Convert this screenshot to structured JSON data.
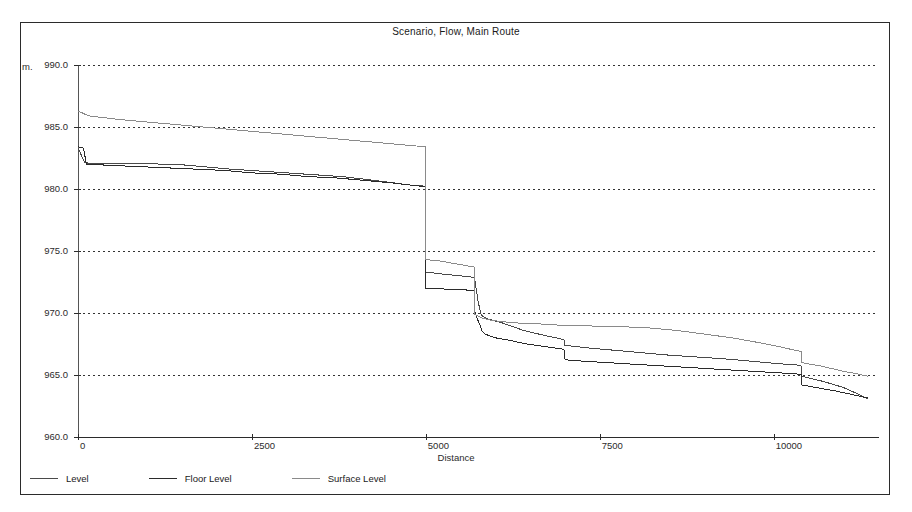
{
  "window": {
    "title": "Scenario, Flow, Main Route"
  },
  "chart_data": {
    "type": "line",
    "title": "Scenario, Flow, Main Route",
    "xlabel": "Distance",
    "ylabel": "m.",
    "xlim": [
      0,
      11500
    ],
    "ylim": [
      960.0,
      990.0
    ],
    "grid": true,
    "grid_style": "dotted-horizontal",
    "legend_position": "bottom-left",
    "x_ticks": [
      "0",
      "2500",
      "5000",
      "7500",
      "10000"
    ],
    "x_tick_values": [
      0,
      2500,
      5000,
      7500,
      10000
    ],
    "y_ticks": [
      "960.0",
      "965.0",
      "970.0",
      "975.0",
      "980.0",
      "985.0",
      "990.0"
    ],
    "y_tick_values": [
      960.0,
      965.0,
      970.0,
      975.0,
      980.0,
      985.0,
      990.0
    ],
    "series": [
      {
        "name": "Level",
        "color": "#4a4a4a",
        "x": [
          0,
          100,
          600,
          1400,
          2200,
          3000,
          3800,
          4400,
          4800,
          4950,
          4980,
          5000,
          5000,
          5150,
          5300,
          5500,
          5650,
          5700,
          5700,
          5750,
          5780,
          5800,
          5900,
          6100,
          6400,
          6700,
          6950,
          6980,
          7000,
          7000,
          7300,
          7700,
          8100,
          8500,
          8900,
          9300,
          9700,
          10100,
          10350,
          10380,
          10400,
          10400,
          10700,
          11000,
          11200,
          11350
        ],
        "y": [
          983.3,
          982.1,
          982.05,
          982.0,
          981.6,
          981.3,
          981.0,
          980.6,
          980.3,
          980.25,
          980.2,
          980.2,
          973.3,
          973.2,
          973.1,
          973.0,
          972.9,
          972.85,
          972.8,
          971.0,
          970.2,
          969.8,
          969.5,
          969.2,
          968.6,
          968.2,
          967.9,
          967.85,
          967.8,
          967.4,
          967.2,
          967.0,
          966.8,
          966.6,
          966.45,
          966.3,
          966.1,
          965.9,
          965.8,
          965.75,
          965.7,
          964.9,
          964.5,
          964.0,
          963.5,
          963.1
        ]
      },
      {
        "name": "Floor Level",
        "color": "#2b2b2b",
        "x": [
          0,
          80,
          120,
          500,
          900,
          1300,
          1700,
          2100,
          2500,
          2900,
          3300,
          3700,
          4100,
          4500,
          4800,
          4980,
          5000,
          5000,
          5200,
          5400,
          5600,
          5700,
          5700,
          5750,
          5790,
          5800,
          5850,
          6000,
          6200,
          6450,
          6700,
          6950,
          7000,
          7000,
          7050,
          7300,
          7600,
          7900,
          8200,
          8500,
          8800,
          9100,
          9400,
          9700,
          10000,
          10300,
          10400,
          10400,
          10600,
          10900,
          11150,
          11350
        ],
        "y": [
          983.4,
          983.3,
          982.0,
          981.9,
          981.8,
          981.7,
          981.6,
          981.5,
          981.3,
          981.2,
          981.0,
          980.9,
          980.7,
          980.5,
          980.3,
          980.2,
          980.2,
          972.0,
          971.95,
          971.9,
          971.85,
          971.8,
          970.2,
          969.4,
          968.9,
          968.6,
          968.3,
          968.0,
          967.8,
          967.5,
          967.3,
          967.1,
          967.0,
          966.3,
          966.2,
          966.1,
          966.0,
          965.9,
          965.8,
          965.7,
          965.6,
          965.5,
          965.4,
          965.3,
          965.2,
          965.1,
          965.05,
          964.2,
          964.0,
          963.7,
          963.4,
          963.15
        ]
      },
      {
        "name": "Surface Level",
        "color": "#8a8a8a",
        "x": [
          0,
          150,
          600,
          1200,
          1800,
          2400,
          3000,
          3600,
          4200,
          4600,
          4900,
          4980,
          5000,
          5000,
          5200,
          5400,
          5600,
          5700,
          5700,
          5800,
          5950,
          6100,
          6300,
          6500,
          6700,
          6850,
          6950,
          7000,
          7000,
          7400,
          7800,
          8200,
          8600,
          9000,
          9400,
          9800,
          10150,
          10300,
          10400,
          10400,
          10700,
          11000,
          11200,
          11350
        ],
        "y": [
          986.3,
          985.9,
          985.6,
          985.3,
          985.0,
          984.7,
          984.4,
          984.1,
          983.8,
          983.6,
          983.45,
          983.4,
          983.4,
          974.3,
          974.2,
          974.0,
          973.8,
          973.7,
          969.9,
          969.6,
          969.4,
          969.3,
          969.2,
          969.15,
          969.1,
          969.05,
          969.0,
          969.0,
          969.0,
          968.95,
          968.9,
          968.8,
          968.6,
          968.3,
          968.0,
          967.6,
          967.2,
          967.0,
          966.9,
          966.0,
          965.7,
          965.3,
          965.1,
          964.9
        ]
      }
    ]
  },
  "axes": {
    "y_unit": "m.",
    "x_title": "Distance"
  },
  "legend": {
    "entries": [
      {
        "label": "Level",
        "color": "#4a4a4a"
      },
      {
        "label": "Floor Level",
        "color": "#2b2b2b"
      },
      {
        "label": "Surface Level",
        "color": "#8a8a8a"
      }
    ]
  }
}
